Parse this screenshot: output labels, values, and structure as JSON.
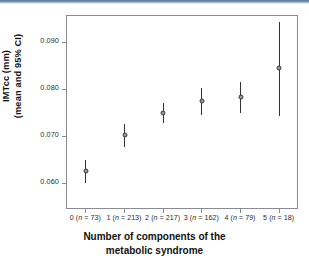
{
  "figure": {
    "background": "#ffffff",
    "frame_color": "#8a8a92",
    "point_color": "#9a9a9a",
    "line_color": "#333333"
  },
  "chart_data": {
    "type": "scatter",
    "title": "",
    "xlabel_line1": "Number of components of the",
    "xlabel_line2": "metabolic syndrome",
    "ylabel_line1": "IMTcc (mm)",
    "ylabel_line2": "(mean and 95% CI)",
    "grid": false,
    "legend": null,
    "ylim": [
      0.0545,
      0.0958
    ],
    "yticks": [
      0.06,
      0.07,
      0.08,
      0.09
    ],
    "ytick_labels": [
      "0.060",
      "0.070",
      "0.080",
      "0.090"
    ],
    "categories": [
      "0",
      "1",
      "2",
      "3",
      "4",
      "5"
    ],
    "counts": [
      73,
      213,
      217,
      162,
      79,
      18
    ],
    "xtick_labels": [
      "0 (n = 73)",
      "1 (n = 213)",
      "2 (n = 217)",
      "3 (n = 162)",
      "4 (n = 79)",
      "5 (n = 18)"
    ],
    "series": [
      {
        "name": "IMTcc mean and 95% CI",
        "values": [
          0.0625,
          0.0703,
          0.0749,
          0.0774,
          0.0783,
          0.0845
        ],
        "ci_low": [
          0.06,
          0.0678,
          0.0728,
          0.0745,
          0.075,
          0.0744
        ],
        "ci_high": [
          0.065,
          0.0727,
          0.077,
          0.0803,
          0.0816,
          0.0943
        ]
      }
    ]
  }
}
